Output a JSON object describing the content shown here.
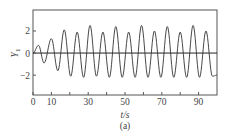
{
  "chart_data": {
    "type": "line",
    "title": "",
    "xlabel": "t/s",
    "ylabel": "Y1",
    "caption": "(a)",
    "xlim": [
      0,
      100
    ],
    "ylim": [
      -3.8,
      3.9
    ],
    "xticks": [
      0,
      10,
      30,
      50,
      70,
      90
    ],
    "xtick_minor": [
      20,
      40,
      60,
      80
    ],
    "yticks": [
      -2,
      0,
      2
    ],
    "grid": false,
    "zero_line": true,
    "series": [
      {
        "name": "Y1",
        "color": "#333333",
        "x": [
          0,
          3,
          6,
          10,
          13.5,
          17,
          20.5,
          24,
          27.5,
          31,
          34.5,
          38,
          41.5,
          45,
          48.5,
          52,
          55.5,
          59,
          62.5,
          66,
          69.5,
          73,
          76.5,
          80,
          83.5,
          87,
          90.5,
          94,
          97.5,
          100
        ],
        "y": [
          0,
          0.7,
          -0.9,
          1.3,
          -1.6,
          2.1,
          -2.1,
          1.9,
          -2.2,
          2.5,
          -2.1,
          1.9,
          -2.2,
          2.4,
          -2.2,
          1.9,
          -2.2,
          2.5,
          -2.2,
          2.0,
          -2.2,
          2.4,
          -2.2,
          1.9,
          -2.2,
          2.5,
          -2.2,
          2.0,
          -2.1,
          -2.0
        ]
      }
    ]
  },
  "labels": {
    "xlabel": "t/s",
    "ylabel": "Y",
    "ylabel_sub": "1",
    "caption": "(a)"
  }
}
